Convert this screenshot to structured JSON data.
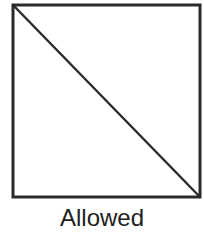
{
  "diagram": {
    "type": "square-with-diagonal",
    "square": {
      "x": 13,
      "y": 5,
      "width": 187,
      "height": 192
    },
    "diagonal": {
      "from": "top-left",
      "to": "bottom-right"
    },
    "stroke_color": "#2a2a2a",
    "fill_color": "#ffffff"
  },
  "caption": {
    "label": "Allowed"
  }
}
